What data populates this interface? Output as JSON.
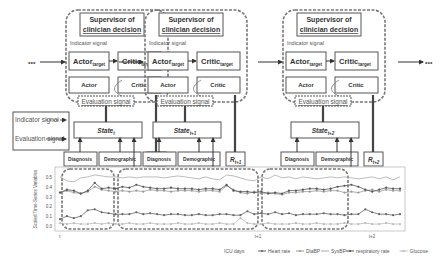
{
  "modules": [
    {
      "id": "t",
      "supervisor": "Supervisor of clinician decision",
      "indicator": "Indicator signal",
      "actor_target": "Actor",
      "critic_target": "Critic",
      "target_sub": "target",
      "actor": "Actor",
      "critic": "Critic",
      "evaluation": "Evaluation signal",
      "state": "State",
      "state_sub": "t",
      "reward": "R",
      "reward_sub": "t",
      "diagnosis": "Diagnosis",
      "demographic": "Demographic"
    },
    {
      "id": "t+1",
      "supervisor": "Supervisor of clinician decision",
      "indicator": "Indicator signal",
      "actor_target": "Actor",
      "critic_target": "Critic",
      "target_sub": "target",
      "actor": "Actor",
      "critic": "Critic",
      "evaluation": "Evaluation signal",
      "state": "State",
      "state_sub": "t+1",
      "reward": "R",
      "reward_sub": "t+1",
      "diagnosis": "Diagnosis",
      "demographic": "Demographic"
    },
    {
      "id": "t+2",
      "supervisor": "Supervisor of clinician decision",
      "indicator": "Indicator signal",
      "actor_target": "Actor",
      "critic_target": "Critic",
      "target_sub": "target",
      "actor": "Actor",
      "critic": "Critic",
      "evaluation": "Evaluation signal",
      "state": "State",
      "state_sub": "t+2",
      "reward": "R",
      "reward_sub": "t+2",
      "diagnosis": "Diagnosis",
      "demographic": "Demographic"
    }
  ],
  "legend_box": {
    "indicator": "Indicator signal",
    "evaluation": "Evaluation signal"
  },
  "ellipsis": "•••",
  "chart_data": {
    "type": "line",
    "ylabel": "Scaled Time-Series Variables",
    "xlabel": "ICU days",
    "yticks": [
      "0.0",
      "0.1",
      "0.2",
      "0.3",
      "0.4",
      "0.5"
    ],
    "ylim": [
      0,
      0.55
    ],
    "xticks": [
      "t",
      "t+1",
      "t+2"
    ],
    "legend_title": "ICU days",
    "series": [
      {
        "name": "Heart rate",
        "color": "#666",
        "marker": "circle",
        "values": [
          0.07,
          0.1,
          0.08,
          0.1,
          0.16,
          0.17,
          0.14,
          0.13,
          0.12,
          0.12,
          0.12,
          0.14,
          0.12,
          0.13,
          0.12,
          0.11,
          0.12,
          0.12,
          0.11,
          0.11,
          0.12,
          0.11,
          0.11,
          0.12,
          0.12,
          0.11,
          0.11,
          0.15,
          0.12,
          0.13,
          0.12,
          0.14,
          0.12,
          0.13,
          0.11,
          0.12,
          0.12,
          0.12,
          0.13,
          0.12,
          0.12,
          0.11,
          0.12,
          0.12,
          0.17,
          0.14,
          0.12,
          0.12,
          0.11,
          0.12
        ]
      },
      {
        "name": "DiaBP",
        "color": "#999",
        "marker": "plus",
        "values": [
          0.34,
          0.36,
          0.34,
          0.33,
          0.35,
          0.4,
          0.37,
          0.36,
          0.35,
          0.36,
          0.35,
          0.36,
          0.35,
          0.37,
          0.36,
          0.36,
          0.35,
          0.36,
          0.36,
          0.36,
          0.35,
          0.36,
          0.36,
          0.35,
          0.41,
          0.37,
          0.34,
          0.33,
          0.35,
          0.33,
          0.34,
          0.33,
          0.32,
          0.34,
          0.34,
          0.35,
          0.35,
          0.36,
          0.35,
          0.36,
          0.36,
          0.34,
          0.35,
          0.34,
          0.36,
          0.37,
          0.35,
          0.37,
          0.36,
          0.36
        ]
      },
      {
        "name": "SysBP",
        "color": "#aaa",
        "marker": "none",
        "values": [
          0.5,
          0.46,
          0.45,
          0.49,
          0.5,
          0.52,
          0.51,
          0.5,
          0.5,
          0.49,
          0.5,
          0.49,
          0.5,
          0.5,
          0.5,
          0.49,
          0.5,
          0.51,
          0.5,
          0.49,
          0.48,
          0.5,
          0.48,
          0.47,
          0.52,
          0.51,
          0.49,
          0.47,
          0.46,
          0.5,
          0.48,
          0.52,
          0.49,
          0.5,
          0.48,
          0.5,
          0.49,
          0.48,
          0.49,
          0.5,
          0.49,
          0.5,
          0.49,
          0.48,
          0.49,
          0.5,
          0.48,
          0.5,
          0.47,
          0.5
        ]
      },
      {
        "name": "respiratory rate",
        "color": "#555",
        "marker": "star",
        "values": [
          0.34,
          0.37,
          0.36,
          0.33,
          0.36,
          0.44,
          0.38,
          0.39,
          0.38,
          0.4,
          0.39,
          0.42,
          0.4,
          0.39,
          0.38,
          0.38,
          0.39,
          0.38,
          0.38,
          0.38,
          0.37,
          0.38,
          0.38,
          0.37,
          0.42,
          0.36,
          0.35,
          0.35,
          0.34,
          0.35,
          0.33,
          0.34,
          0.33,
          0.36,
          0.36,
          0.37,
          0.38,
          0.38,
          0.37,
          0.38,
          0.4,
          0.41,
          0.42,
          0.4,
          0.37,
          0.35,
          0.37,
          0.39,
          0.38,
          0.38
        ]
      },
      {
        "name": "Glucose",
        "color": "#bbb",
        "marker": "tri",
        "values": [
          0.03,
          0.02,
          0.03,
          0.02,
          0.02,
          0.03,
          0.02,
          0.03,
          0.02,
          0.02,
          0.03,
          0.02,
          0.02,
          0.03,
          0.02,
          0.02,
          0.02,
          0.03,
          0.02,
          0.02,
          0.03,
          0.02,
          0.02,
          0.03,
          0.02,
          0.02,
          0.08,
          0.03,
          0.02,
          0.02,
          0.03,
          0.02,
          0.02,
          0.02,
          0.03,
          0.02,
          0.02,
          0.03,
          0.02,
          0.02,
          0.02,
          0.03,
          0.02,
          0.02,
          0.03,
          0.02,
          0.02,
          0.03,
          0.02,
          0.02
        ]
      }
    ]
  }
}
